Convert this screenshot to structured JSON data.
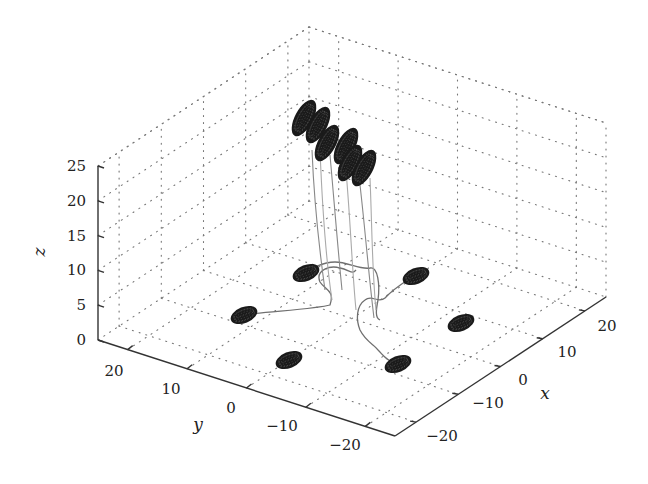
{
  "chart_data": {
    "type": "scatter3d",
    "title": "",
    "xlabel": "x",
    "ylabel": "y",
    "zlabel": "z",
    "xlim": [
      -25,
      25
    ],
    "ylim": [
      -25,
      25
    ],
    "zlim": [
      0,
      25
    ],
    "xticks": [
      -20,
      -10,
      0,
      10,
      20
    ],
    "yticks": [
      20,
      10,
      0,
      -10,
      -20
    ],
    "zticks": [
      0,
      5,
      10,
      15,
      20,
      25
    ],
    "grid": "dotted",
    "disk_color": "#1a1a1a",
    "path_color": "#888888",
    "ground_disks": [
      {
        "x": -20,
        "y": 18,
        "z": 0
      },
      {
        "x": 2,
        "y": 16,
        "z": 0
      },
      {
        "x": -20,
        "y": -1,
        "z": 0
      },
      {
        "x": 20,
        "y": 4,
        "z": 0
      },
      {
        "x": -5,
        "y": -18,
        "z": 0
      },
      {
        "x": 20,
        "y": -18,
        "z": 0
      }
    ],
    "elevated_disks": [
      {
        "x": 3,
        "y": 2,
        "z": 22
      },
      {
        "x": 4,
        "y": 0,
        "z": 22
      },
      {
        "x": 4,
        "y": -2,
        "z": 21
      },
      {
        "x": 7,
        "y": -3,
        "z": 21
      },
      {
        "x": 5,
        "y": -6,
        "z": 20
      },
      {
        "x": 8,
        "y": -7,
        "z": 20
      }
    ],
    "annotations": []
  },
  "axes": {
    "z_ticks": [
      "0",
      "5",
      "10",
      "15",
      "20",
      "25"
    ],
    "y_ticks": [
      "20",
      "10",
      "0",
      "−10",
      "−20"
    ],
    "x_ticks": [
      "−20",
      "−10",
      "0",
      "10",
      "20"
    ],
    "x_label": "x",
    "y_label": "y",
    "z_label": "z"
  }
}
